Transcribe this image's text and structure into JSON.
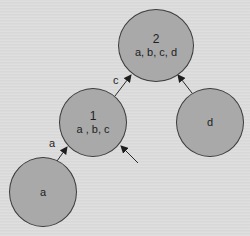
{
  "diagram": {
    "type": "tree",
    "nodes": [
      {
        "id": "node2",
        "title": "2",
        "items": "a, b, c, d"
      },
      {
        "id": "node1",
        "title": "1",
        "items": "a , b, c"
      },
      {
        "id": "nodeD",
        "title": "d"
      },
      {
        "id": "nodeA",
        "title": "a"
      }
    ],
    "edges": [
      {
        "from": "node1",
        "to": "node2",
        "label": "c"
      },
      {
        "from": "nodeD",
        "to": "node2",
        "label": ""
      },
      {
        "from": "nodeA",
        "to": "node1",
        "label": "a"
      },
      {
        "from": "external",
        "to": "node1",
        "label": ""
      }
    ]
  },
  "colors": {
    "background": "#dcdcdc",
    "node_fill": "#a9a9a9",
    "node_stroke": "#3c3c3c",
    "text": "#1e1e1e"
  }
}
